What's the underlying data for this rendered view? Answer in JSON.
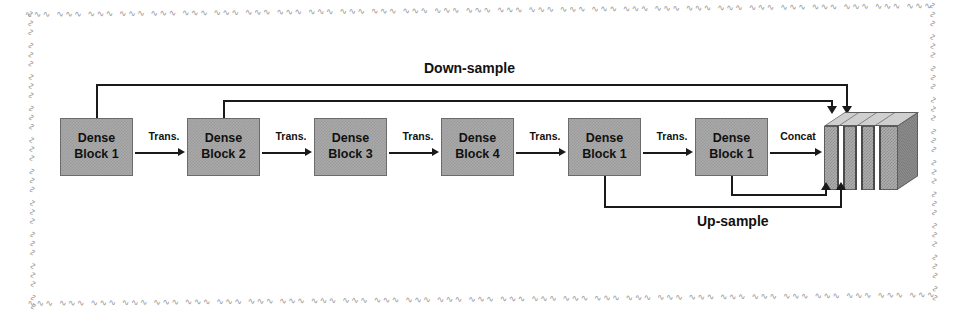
{
  "figure": {
    "frame_style": "sketchy-dashed",
    "colors": {
      "block_fill": "#a9a9a9",
      "block_border": "#6b6b6b",
      "line": "#1a1a1a",
      "frame": "#9a9a9a",
      "text": "#111111"
    },
    "frame_squiggle": "∿∿∿  ∿∿∿  ∿∿∿  ∿∿∿  ∿∿∿  ∿∿∿  ∿∿∿  ∿∿∿  ∿∿∿  ∿∿∿  ∿∿∿  ∿∿∿  ∿∿∿  ∿∿∿  ∿∿∿  ∿∿∿  ∿∿∿  ∿∿∿  ∿∿∿  ∿∿∿  ∿∿∿  ∿∿∿  ∿∿∿  ∿∿∿  ∿∿∿  ∿∿∿  ∿∿∿  ∿∿∿  ∿∿∿  ∿∿∿  ∿∿∿  ∿∿∿  ∿∿∿  ∿∿∿  ∿∿∿  ∿∿∿  ∿∿∿  ∿∿∿  ∿∿∿  ∿∿∿"
  },
  "blocks": [
    {
      "line1": "Dense",
      "line2": "Block 1"
    },
    {
      "line1": "Dense",
      "line2": "Block 2"
    },
    {
      "line1": "Dense",
      "line2": "Block 3"
    },
    {
      "line1": "Dense",
      "line2": "Block 4"
    },
    {
      "line1": "Dense",
      "line2": "Block 1"
    },
    {
      "line1": "Dense",
      "line2": "Block 1"
    }
  ],
  "edge_labels": [
    {
      "text": "Trans."
    },
    {
      "text": "Trans."
    },
    {
      "text": "Trans."
    },
    {
      "text": "Trans."
    },
    {
      "text": "Trans."
    },
    {
      "text": "Concat"
    }
  ],
  "paths": {
    "down_sample": "Down-sample",
    "up_sample": "Up-sample"
  },
  "concat": {
    "name": "concatenated-feature-volume",
    "slab_count": 5
  }
}
